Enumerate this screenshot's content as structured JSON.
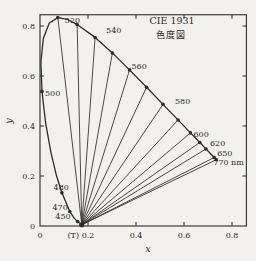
{
  "chart_data": {
    "type": "line",
    "title": "CIE 1931",
    "subtitle": "色度図",
    "xlabel": "x",
    "ylabel": "y",
    "xlim": [
      0,
      0.86
    ],
    "ylim": [
      0,
      0.845
    ],
    "grid": false,
    "legend": false,
    "x_ticks": [
      {
        "value": 0,
        "label": "0"
      },
      {
        "value": 0.2,
        "label": "0.2"
      },
      {
        "value": 0.4,
        "label": "0.4"
      },
      {
        "value": 0.6,
        "label": "0.6"
      },
      {
        "value": 0.8,
        "label": "0.8"
      }
    ],
    "y_ticks": [
      {
        "value": 0,
        "label": "0"
      },
      {
        "value": 0.2,
        "label": "0.2"
      },
      {
        "value": 0.4,
        "label": "0.4"
      },
      {
        "value": 0.6,
        "label": "0.6"
      },
      {
        "value": 0.8,
        "label": "0.8"
      }
    ],
    "t_point": {
      "label": "(T)",
      "x": 0.174,
      "y": 0.005
    },
    "spectral_locus": [
      {
        "nm": 410,
        "x": 0.1726,
        "y": 0.0048
      },
      {
        "nm": 430,
        "x": 0.1689,
        "y": 0.0086
      },
      {
        "nm": 450,
        "x": 0.1566,
        "y": 0.0177
      },
      {
        "nm": 460,
        "x": 0.144,
        "y": 0.0297
      },
      {
        "nm": 470,
        "x": 0.1241,
        "y": 0.0578
      },
      {
        "nm": 480,
        "x": 0.0913,
        "y": 0.1327
      },
      {
        "nm": 485,
        "x": 0.0687,
        "y": 0.2007
      },
      {
        "nm": 490,
        "x": 0.0454,
        "y": 0.295
      },
      {
        "nm": 495,
        "x": 0.0235,
        "y": 0.4127
      },
      {
        "nm": 500,
        "x": 0.0082,
        "y": 0.5384
      },
      {
        "nm": 505,
        "x": 0.0039,
        "y": 0.6548
      },
      {
        "nm": 510,
        "x": 0.0139,
        "y": 0.7502
      },
      {
        "nm": 515,
        "x": 0.0389,
        "y": 0.812
      },
      {
        "nm": 520,
        "x": 0.0743,
        "y": 0.8338
      },
      {
        "nm": 525,
        "x": 0.1142,
        "y": 0.8262
      },
      {
        "nm": 530,
        "x": 0.1547,
        "y": 0.8059
      },
      {
        "nm": 540,
        "x": 0.2296,
        "y": 0.7543
      },
      {
        "nm": 550,
        "x": 0.3016,
        "y": 0.6923
      },
      {
        "nm": 560,
        "x": 0.3731,
        "y": 0.6245
      },
      {
        "nm": 570,
        "x": 0.4441,
        "y": 0.5547
      },
      {
        "nm": 580,
        "x": 0.5125,
        "y": 0.4866
      },
      {
        "nm": 590,
        "x": 0.5752,
        "y": 0.4242
      },
      {
        "nm": 600,
        "x": 0.627,
        "y": 0.3725
      },
      {
        "nm": 610,
        "x": 0.6658,
        "y": 0.334
      },
      {
        "nm": 620,
        "x": 0.6915,
        "y": 0.3083
      },
      {
        "nm": 630,
        "x": 0.7079,
        "y": 0.292
      },
      {
        "nm": 650,
        "x": 0.726,
        "y": 0.274
      },
      {
        "nm": 770,
        "x": 0.7347,
        "y": 0.2653
      }
    ],
    "fan_lines_to_nm": [
      520,
      530,
      540,
      550,
      560,
      570,
      580,
      590,
      600,
      610,
      620,
      650,
      770
    ],
    "marker_nm": [
      450,
      470,
      480,
      500,
      520,
      530,
      540,
      550,
      560,
      570,
      580,
      590,
      600,
      610,
      620,
      650,
      770
    ],
    "wavelength_labels": [
      {
        "nm": 450,
        "text": "450",
        "anchor": "end",
        "dx": -7,
        "dy": -3
      },
      {
        "nm": 470,
        "text": "470",
        "anchor": "end",
        "dx": -2,
        "dy": -2
      },
      {
        "nm": 480,
        "text": "480",
        "anchor": "end",
        "dx": 7,
        "dy": -3
      },
      {
        "nm": 500,
        "text": "500",
        "anchor": "start",
        "dx": 3,
        "dy": 5
      },
      {
        "nm": 520,
        "text": "520",
        "anchor": "start",
        "dx": 7,
        "dy": 5
      },
      {
        "nm": 540,
        "text": "540",
        "anchor": "start",
        "dx": 11,
        "dy": -4
      },
      {
        "nm": 560,
        "text": "560",
        "anchor": "start",
        "dx": 2,
        "dy": -1
      },
      {
        "nm": 580,
        "text": "580",
        "anchor": "start",
        "dx": 12,
        "dy": 0
      },
      {
        "nm": 600,
        "text": "600",
        "anchor": "start",
        "dx": 3,
        "dy": 4
      },
      {
        "nm": 620,
        "text": "620",
        "anchor": "start",
        "dx": 4,
        "dy": -3
      },
      {
        "nm": 650,
        "text": "650",
        "anchor": "start",
        "dx": 3,
        "dy": -2
      },
      {
        "nm": 770,
        "text": "770 nm",
        "anchor": "start",
        "dx": -3,
        "dy": 5
      }
    ],
    "ink_color": "#2e2c28",
    "paper_color": "#f2f1ed"
  }
}
